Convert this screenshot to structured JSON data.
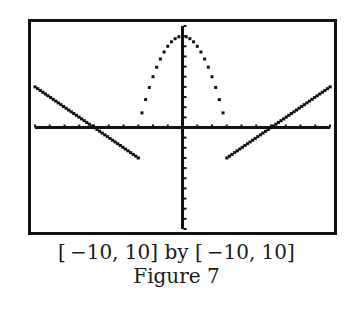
{
  "figure": {
    "window_label": "[ −10, 10] by [ −10, 10]",
    "figure_label": "Figure 7"
  },
  "chart_data": {
    "type": "line",
    "title": "",
    "subtitle": "",
    "xlabel": "",
    "ylabel": "",
    "xlim": [
      -10,
      10
    ],
    "ylim": [
      -10,
      10
    ],
    "xscale_tick": 1,
    "yscale_tick": 1,
    "grid": false,
    "legend": null,
    "axis_color": "#111111",
    "frame_color": "#111111",
    "series": [
      {
        "name": "left-line",
        "style": "solid-pixel",
        "x": [
          -10,
          -3
        ],
        "y": [
          4,
          -3
        ]
      },
      {
        "name": "center-parabola",
        "style": "dotted",
        "x": [
          -3.0,
          -2.75,
          -2.5,
          -2.25,
          -2.0,
          -1.75,
          -1.5,
          -1.25,
          -1.0,
          -0.75,
          -0.5,
          -0.25,
          0.0,
          0.25,
          0.5,
          0.75,
          1.0,
          1.25,
          1.5,
          1.75,
          2.0,
          2.25,
          2.5,
          2.75,
          3.0
        ],
        "y": [
          0.0,
          1.44,
          2.75,
          3.94,
          5.0,
          5.94,
          6.75,
          7.44,
          8.0,
          8.44,
          8.75,
          8.94,
          9.0,
          8.94,
          8.75,
          8.44,
          8.0,
          7.44,
          6.75,
          5.94,
          5.0,
          3.94,
          2.75,
          1.44,
          0.0
        ]
      },
      {
        "name": "right-line",
        "style": "solid-pixel",
        "x": [
          3,
          10
        ],
        "y": [
          -3,
          4
        ]
      }
    ],
    "annotations": [
      "[-10, 10] by [-10, 10]",
      "Figure 7"
    ]
  }
}
